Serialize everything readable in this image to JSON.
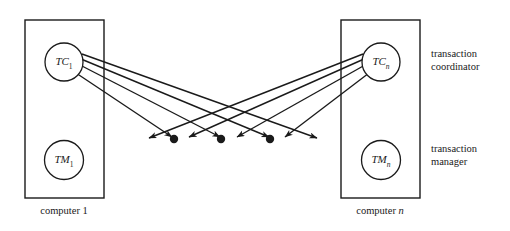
{
  "figure": {
    "type": "diagram"
  },
  "boxes": [
    {
      "id": "computer-1",
      "caption": "computer 1",
      "caption_italic_suffix": "",
      "x": 25,
      "y": 20,
      "w": 79,
      "h": 178,
      "caption_x": 64,
      "caption_y": 205
    },
    {
      "id": "computer-n",
      "caption": "computer ",
      "caption_italic_suffix": "n",
      "x": 341,
      "y": 20,
      "w": 79,
      "h": 178,
      "caption_x": 380,
      "caption_y": 205
    }
  ],
  "nodes": [
    {
      "id": "tc1",
      "base": "TC",
      "sub": "1",
      "cx": 64,
      "cy": 62,
      "r": 19
    },
    {
      "id": "tm1",
      "base": "TM",
      "sub": "1",
      "cx": 64,
      "cy": 160,
      "r": 19.5
    },
    {
      "id": "tcn",
      "base": "TC",
      "sub": "n",
      "cx": 381,
      "cy": 62,
      "r": 19
    },
    {
      "id": "tmn",
      "base": "TM",
      "sub": "n",
      "cx": 381,
      "cy": 160,
      "r": 19.5
    }
  ],
  "side_labels": [
    {
      "id": "transaction-coordinator",
      "line1": "transaction",
      "line2": "coordinator",
      "x": 431,
      "y": 48
    },
    {
      "id": "transaction-manager",
      "line1": "transaction",
      "line2": "manager",
      "x": 431,
      "y": 143
    }
  ],
  "edges": {
    "stroke": "#1a1a1a",
    "stroke_width": 1.4,
    "from_tc1": [
      {
        "x1": 82,
        "y1": 54,
        "x2": 317,
        "y2": 138
      },
      {
        "x1": 81,
        "y1": 59,
        "x2": 269,
        "y2": 137
      },
      {
        "x1": 80,
        "y1": 65,
        "x2": 220,
        "y2": 137
      },
      {
        "x1": 76,
        "y1": 73,
        "x2": 172,
        "y2": 137
      }
    ],
    "from_tcn": [
      {
        "x1": 363,
        "y1": 54,
        "x2": 149,
        "y2": 138
      },
      {
        "x1": 364,
        "y1": 59,
        "x2": 189,
        "y2": 137
      },
      {
        "x1": 365,
        "y1": 65,
        "x2": 237,
        "y2": 137
      },
      {
        "x1": 369,
        "y1": 73,
        "x2": 285,
        "y2": 137
      }
    ]
  },
  "dots": [
    {
      "cx": 174,
      "cy": 139,
      "r": 4.2
    },
    {
      "cx": 221,
      "cy": 139,
      "r": 4.2
    },
    {
      "cx": 270,
      "cy": 139,
      "r": 4.2
    }
  ],
  "colors": {
    "ink": "#1a1a1a",
    "background": "#ffffff"
  }
}
